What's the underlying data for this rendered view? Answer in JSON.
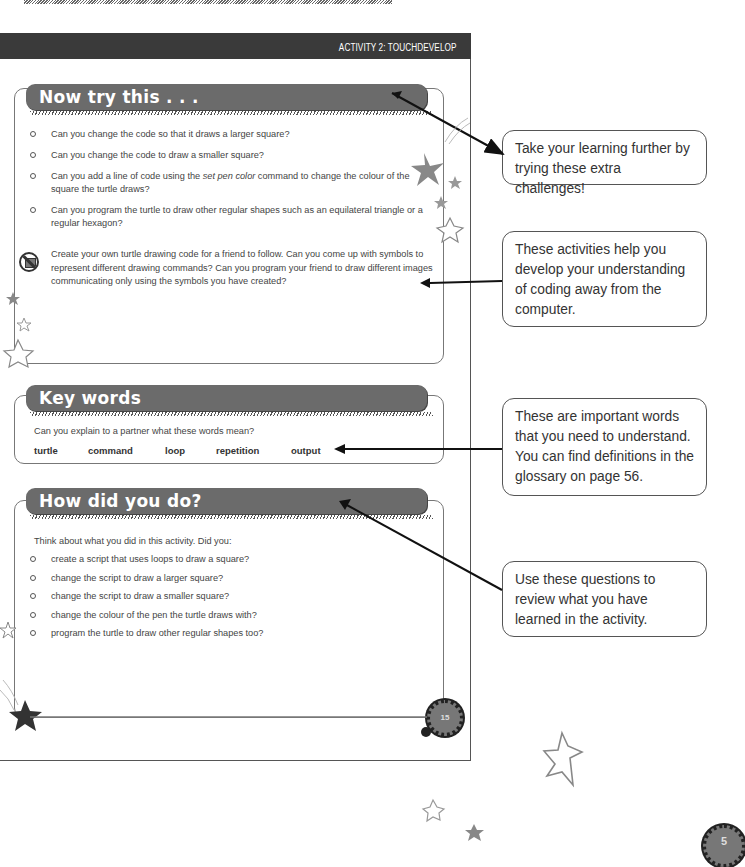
{
  "header": {
    "title": "ACTIVITY 2: TOUCHDEVELOP"
  },
  "now_try": {
    "title": "Now try this . . .",
    "bullets": [
      "Can you change the code so that it draws a larger square?",
      "Can you change the code to draw a smaller square?",
      "Can you add a line of code using the set pen color command to change the colour of the square the turtle draws?",
      "Can you program the turtle to draw other regular shapes such as an equilateral triangle or a regular hexagon?"
    ],
    "bullet3_pre": "Can you add a line of code using the ",
    "bullet3_em": "set pen color",
    "bullet3_post": " command to change the colour of the square the turtle draws?",
    "unplugged_icon": "no-computer-icon",
    "unplugged_text": "Create your own turtle drawing code for a friend to follow. Can you come up with symbols to represent different drawing commands? Can you program your friend to draw different images communicating only using the symbols you have created?"
  },
  "key_words": {
    "title": "Key words",
    "prompt": "Can you explain to a partner what these words mean?",
    "words": [
      "turtle",
      "command",
      "loop",
      "repetition",
      "output"
    ]
  },
  "how_did": {
    "title": "How did you do?",
    "intro": "Think about what you did in this activity. Did you:",
    "bullets": [
      "create a script that uses loops to draw a square?",
      "change the script to draw a larger square?",
      "change the script to draw a smaller square?",
      "change the colour of the pen the turtle draws with?",
      "program the turtle to draw other regular shapes too?"
    ]
  },
  "page_number_inner": "15",
  "page_number_outer": "5",
  "callouts": [
    "Take your learning further by trying these extra challenges!",
    "These activities help you develop your understanding of coding away from the computer.",
    "These are important words that you need to understand. You can find definitions in the glossary on page 56.",
    "Use these questions to review what you have learned in the activity."
  ]
}
